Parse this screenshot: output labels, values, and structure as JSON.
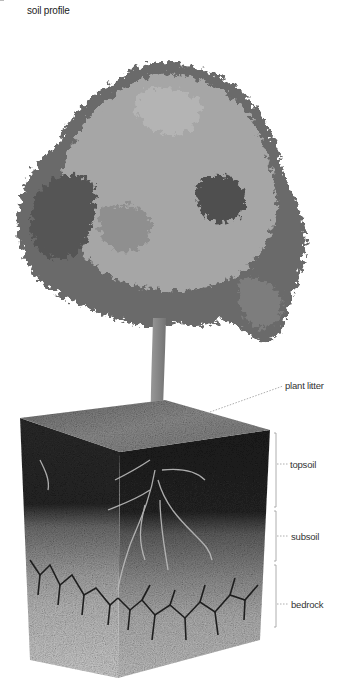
{
  "title": "soil profile",
  "illustration": {
    "subject": "tree above cutaway soil block",
    "colors": {
      "foliage_light": "#a8a8a8",
      "foliage_dark": "#4a4a4a",
      "trunk": "#8a8a8a",
      "topsoil_top": "#8c8c8c",
      "topsoil": "#2a2a2a",
      "subsoil": "#9a9a9a",
      "bedrock": "#c4c4c4",
      "bedrock_cracks": "#1e1e1e",
      "leader_line": "#999999"
    }
  },
  "labels": {
    "plant_litter": "plant litter",
    "topsoil": "topsoil",
    "subsoil": "subsoil",
    "bedrock": "bedrock"
  }
}
